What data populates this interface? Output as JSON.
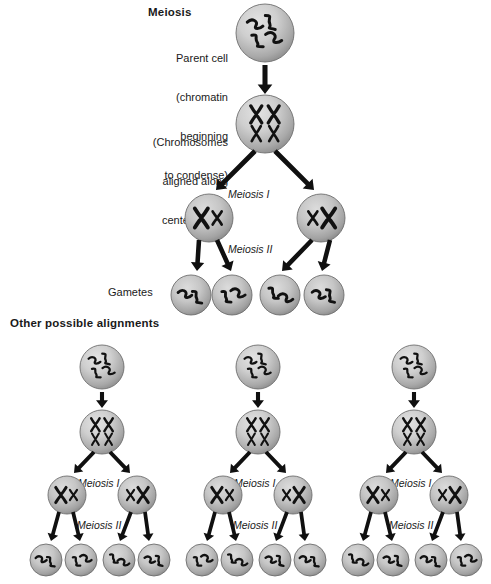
{
  "figure": {
    "title": "Meiosis",
    "subtitle": "Other possible alignments",
    "background_color": "#ffffff",
    "cell_fill_light": "#d8d8d8",
    "cell_fill_dark": "#8e8e8e",
    "cell_stroke": "#6e6e6e",
    "chromosome_color": "#111111",
    "arrow_color": "#101010",
    "text_color": "#1a1a1a"
  },
  "labels": {
    "meiosis_title": "Meiosis",
    "parent_cell": "Parent cell\n(chromatin\nbeginning\nto condense)",
    "parent_cell_line1": "Parent cell",
    "parent_cell_line2": "(chromatin",
    "parent_cell_line3": "beginning",
    "parent_cell_line4": "to condense)",
    "metaphase_line1": "(Chromosomes",
    "metaphase_line2": "aligned along",
    "metaphase_line3": "center of cell)",
    "meiosis_one": "Meiosis I",
    "meiosis_two": "Meiosis II",
    "gametes": "Gametes",
    "other_alignments": "Other possible alignments"
  },
  "main_diagram": {
    "stages": [
      {
        "name": "parent-cell",
        "stage_type": "chromatin",
        "cell_count": 1,
        "radius": 29,
        "description": "Parent cell with condensing chromatin - four squiggly strands"
      },
      {
        "name": "metaphase-cell",
        "stage_type": "aligned-tetrads",
        "cell_count": 1,
        "radius": 29,
        "description": "Chromosomes aligned along center of cell - two tetrad pairs stacked"
      },
      {
        "name": "meiosis-one-daughters",
        "stage_type": "paired-chromosomes",
        "cell_count": 2,
        "radius": 24,
        "description": "Two daughter cells each with one large and one small X chromosome"
      },
      {
        "name": "gamete-cells",
        "stage_type": "single-chromatids",
        "cell_count": 4,
        "radius": 20,
        "description": "Four haploid gametes each with two squiggly chromatids"
      }
    ]
  },
  "alternative_alignments": {
    "column_count": 3,
    "columns": [
      {
        "name": "alignment-column-1",
        "stage_rows": [
          "chromatin",
          "aligned-tetrads",
          "paired-chromosomes",
          "single-chromatids"
        ],
        "gamete_count": 4,
        "meiosis_one_label": "Meiosis I",
        "meiosis_two_label": "Meiosis II"
      },
      {
        "name": "alignment-column-2",
        "stage_rows": [
          "chromatin",
          "aligned-tetrads",
          "paired-chromosomes",
          "single-chromatids"
        ],
        "gamete_count": 4,
        "meiosis_one_label": "Meiosis I",
        "meiosis_two_label": "Meiosis II"
      },
      {
        "name": "alignment-column-3",
        "stage_rows": [
          "chromatin",
          "aligned-tetrads",
          "paired-chromosomes",
          "single-chromatids"
        ],
        "gamete_count": 4,
        "meiosis_one_label": "Meiosis I",
        "meiosis_two_label": "Meiosis II"
      }
    ]
  }
}
